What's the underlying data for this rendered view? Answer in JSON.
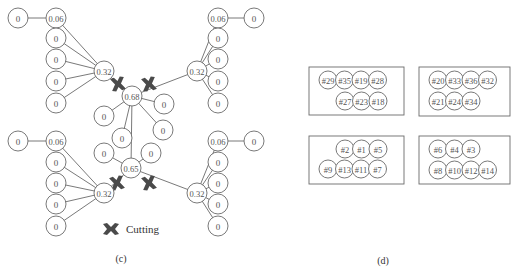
{
  "panel_c": {
    "caption": "(c)",
    "legend": {
      "icon": "cutting-icon",
      "label": "Cutting"
    },
    "clusters": [
      {
        "id": "top-left",
        "hub": "0.32",
        "first_leaf": "0.06",
        "outer_leaf": "0",
        "leaves": [
          "0",
          "0",
          "0",
          "0"
        ]
      },
      {
        "id": "top-right",
        "hub": "0.32",
        "first_leaf": "0.06",
        "outer_leaf": "0",
        "leaves": [
          "0",
          "0",
          "0",
          "0"
        ]
      },
      {
        "id": "bottom-left",
        "hub": "0.32",
        "first_leaf": "0.06",
        "outer_leaf": "0",
        "leaves": [
          "0",
          "0",
          "0",
          "0"
        ]
      },
      {
        "id": "bottom-right",
        "hub": "0.32",
        "first_leaf": "0.06",
        "outer_leaf": "0",
        "leaves": [
          "0",
          "0",
          "0",
          "0"
        ]
      }
    ],
    "center_top": {
      "hub": "0.68",
      "leaves": [
        "0",
        "0",
        "0",
        "0"
      ]
    },
    "center_bottom": {
      "hub": "0.65",
      "leaves": [
        "0",
        "0"
      ]
    }
  },
  "panel_d": {
    "caption": "(d)",
    "groups": [
      {
        "row1": [
          "#29",
          "#35",
          "#19",
          "#28"
        ],
        "row2": [
          "#27",
          "#23",
          "#18"
        ]
      },
      {
        "row1": [
          "#20",
          "#33",
          "#36",
          "#32"
        ],
        "row2": [
          "#21",
          "#24",
          "#34"
        ]
      },
      {
        "row1": [
          "#2",
          "#1",
          "#5"
        ],
        "row2": [
          "#9",
          "#13",
          "#11",
          "#7"
        ]
      },
      {
        "row1": [
          "#6",
          "#4",
          "#3"
        ],
        "row2": [
          "#8",
          "#10",
          "#12",
          "#14"
        ]
      }
    ]
  }
}
